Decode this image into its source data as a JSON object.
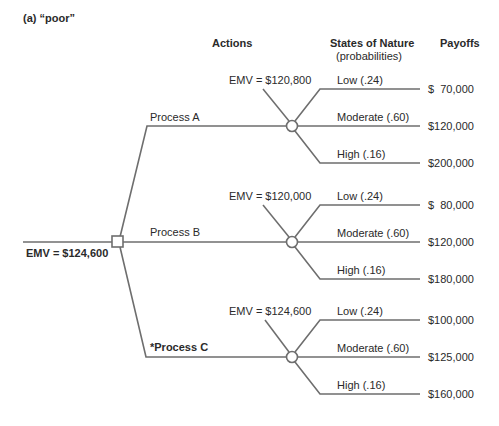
{
  "figure": {
    "label": "(a) “poor”",
    "headers": {
      "actions": "Actions",
      "states": "States of Nature",
      "states_sub": "(probabilities)",
      "payoffs": "Payoffs"
    },
    "root": {
      "emv": "EMV = $124,600",
      "node_type": "decision"
    },
    "actions": [
      {
        "label": "Process A",
        "emv": "EMV = $120,800",
        "outcomes": [
          {
            "state": "Low (.24)",
            "payoff": "$  70,000"
          },
          {
            "state": "Moderate (.60)",
            "payoff": "$120,000"
          },
          {
            "state": "High (.16)",
            "payoff": "$200,000"
          }
        ]
      },
      {
        "label": "Process B",
        "emv": "EMV = $120,000",
        "outcomes": [
          {
            "state": "Low (.24)",
            "payoff": "$  80,000"
          },
          {
            "state": "Moderate (.60)",
            "payoff": "$120,000"
          },
          {
            "state": "High (.16)",
            "payoff": "$180,000"
          }
        ]
      },
      {
        "label": "*Process C",
        "emv": "EMV = $124,600",
        "outcomes": [
          {
            "state": "Low (.24)",
            "payoff": "$100,000"
          },
          {
            "state": "Moderate (.60)",
            "payoff": "$125,000"
          },
          {
            "state": "High (.16)",
            "payoff": "$160,000"
          }
        ]
      }
    ],
    "colors": {
      "line": "#6e6e6e",
      "text": "#2a2a2a",
      "background": "#ffffff"
    }
  }
}
